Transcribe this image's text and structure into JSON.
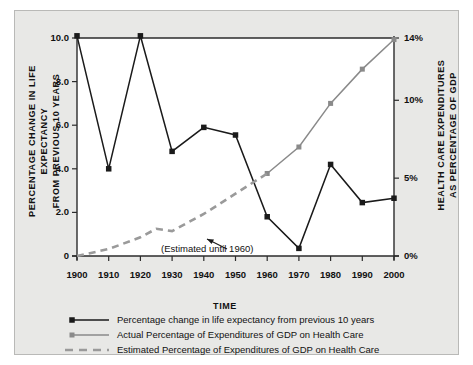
{
  "figure": {
    "background": "#e8e8e6",
    "plot_background": "#ffffff",
    "border_color": "#b9b9b7"
  },
  "axes": {
    "left_title": "PERCENTAGE CHANGE  IN LIFE EXPECTANCY\nFROM PREVIOUS 10 YEARS",
    "right_title": "HEALTH CARE EXPENDITURES\nAS PERCENTAGE OF GDP",
    "x_title": "TIME",
    "left_ticks": [
      "0",
      "2.0",
      "4.0",
      "6.0",
      "8.0",
      "10.0"
    ],
    "right_ticks": [
      "0%",
      "5%",
      "10%",
      "14%"
    ],
    "x_ticks": [
      "1900",
      "1910",
      "1920",
      "1930",
      "1940",
      "1950",
      "1960",
      "1970",
      "1980",
      "1990",
      "2000"
    ]
  },
  "annotation": {
    "text": "(Estimated until 1960)"
  },
  "legend": {
    "items": [
      {
        "label": "Percentage change in life expectancy from previous 10 years",
        "style": "solid-black-square",
        "color": "#1a1a1a"
      },
      {
        "label": "Actual Percentage of Expenditures of GDP on Health Care",
        "style": "solid-gray-square",
        "color": "#8a8a8a"
      },
      {
        "label": "Estimated Percentage of Expenditures of GDP on Health Care",
        "style": "dashed-gray",
        "color": "#9a9a9a"
      }
    ]
  },
  "chart_data": {
    "type": "line",
    "title": "",
    "xlabel": "TIME",
    "ylabel": "PERCENTAGE CHANGE IN LIFE EXPECTANCY FROM PREVIOUS 10 YEARS",
    "y2label": "HEALTH CARE EXPENDITURES AS PERCENTAGE OF GDP",
    "x": [
      1900,
      1910,
      1920,
      1930,
      1940,
      1950,
      1960,
      1970,
      1980,
      1990,
      2000
    ],
    "xlim": [
      1900,
      2000
    ],
    "ylim": [
      0,
      10
    ],
    "y2lim": [
      0,
      14
    ],
    "grid": false,
    "legend_position": "bottom",
    "series": [
      {
        "name": "Percentage change in life expectancy from previous 10 years",
        "axis": "left",
        "color": "#1a1a1a",
        "marker": "square",
        "linestyle": "solid",
        "x": [
          1900,
          1910,
          1920,
          1930,
          1940,
          1950,
          1960,
          1970,
          1980,
          1990,
          2000
        ],
        "values": [
          10.1,
          4.0,
          10.1,
          4.8,
          5.9,
          5.55,
          1.8,
          0.35,
          4.2,
          2.45,
          2.65
        ]
      },
      {
        "name": "Actual Percentage of Expenditures of GDP on Health Care",
        "axis": "right",
        "color": "#8a8a8a",
        "marker": "square",
        "linestyle": "solid",
        "x": [
          1960,
          1970,
          1980,
          1990,
          2000
        ],
        "values": [
          5.3,
          7.0,
          9.8,
          12.0,
          13.9
        ]
      },
      {
        "name": "Estimated Percentage of Expenditures of GDP on Health Care",
        "axis": "right",
        "color": "#9a9a9a",
        "marker": "none",
        "linestyle": "dashed",
        "x": [
          1900,
          1910,
          1920,
          1925,
          1930,
          1940,
          1950,
          1960
        ],
        "values": [
          0.0,
          0.45,
          1.2,
          1.75,
          1.6,
          2.7,
          4.0,
          5.3
        ]
      }
    ]
  }
}
